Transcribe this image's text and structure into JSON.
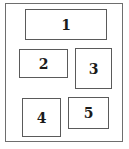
{
  "diagram": {
    "type": "layout-regions",
    "frame": {
      "x": 5,
      "y": 3,
      "w": 118,
      "h": 139
    },
    "boxes": [
      {
        "label": "1",
        "x": 25,
        "y": 9,
        "w": 82,
        "h": 31
      },
      {
        "label": "2",
        "x": 19,
        "y": 49,
        "w": 49,
        "h": 29
      },
      {
        "label": "3",
        "x": 75,
        "y": 48,
        "w": 37,
        "h": 41
      },
      {
        "label": "4",
        "x": 22,
        "y": 98,
        "w": 39,
        "h": 39
      },
      {
        "label": "5",
        "x": 68,
        "y": 97,
        "w": 41,
        "h": 32
      }
    ]
  }
}
